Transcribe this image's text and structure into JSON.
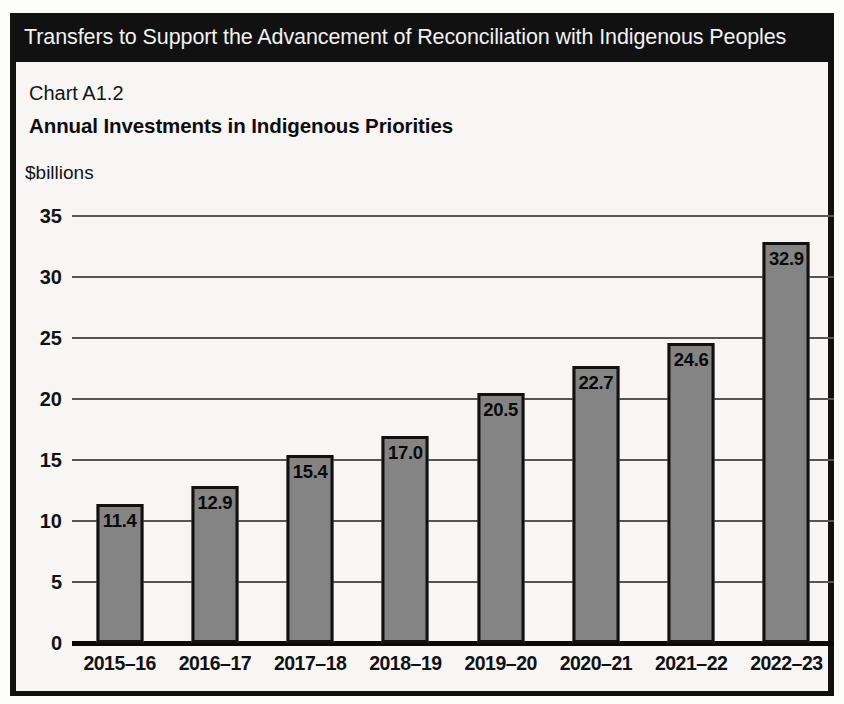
{
  "header": {
    "title": "Transfers to Support the Advancement of Reconciliation with Indigenous Peoples"
  },
  "chart_header": {
    "number": "Chart A1.2",
    "title": "Annual Investments in Indigenous Priorities",
    "unit": "$billions"
  },
  "chart_data": {
    "type": "bar",
    "title": "Annual Investments in Indigenous Priorities",
    "subtitle": "Chart A1.2",
    "xlabel": "",
    "ylabel": "$billions",
    "categories": [
      "2015–16",
      "2016–17",
      "2017–18",
      "2018–19",
      "2019–20",
      "2020–21",
      "2021–22",
      "2022–23"
    ],
    "values": [
      11.4,
      12.9,
      15.4,
      17.0,
      20.5,
      22.7,
      24.6,
      32.9
    ],
    "value_labels": [
      "11.4",
      "12.9",
      "15.4",
      "17.0",
      "20.5",
      "22.7",
      "24.6",
      "32.9"
    ],
    "ylim": [
      0,
      35
    ],
    "yticks": [
      0,
      5,
      10,
      15,
      20,
      25,
      30,
      35
    ],
    "ytick_labels": [
      "0",
      "5",
      "10",
      "15",
      "20",
      "25",
      "30",
      "35"
    ],
    "grid": true,
    "legend": null,
    "bar_color": "#848484",
    "bar_border_color": "#111111",
    "background": "#f7f6f4"
  }
}
